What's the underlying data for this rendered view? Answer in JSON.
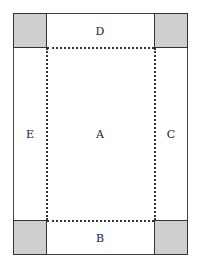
{
  "diagram": {
    "regions": {
      "A": "A",
      "B": "B",
      "C": "C",
      "D": "D",
      "E": "E"
    },
    "colors": {
      "corner_fill": "#cfcfcf",
      "line": "#333333",
      "background": "#ffffff"
    }
  }
}
